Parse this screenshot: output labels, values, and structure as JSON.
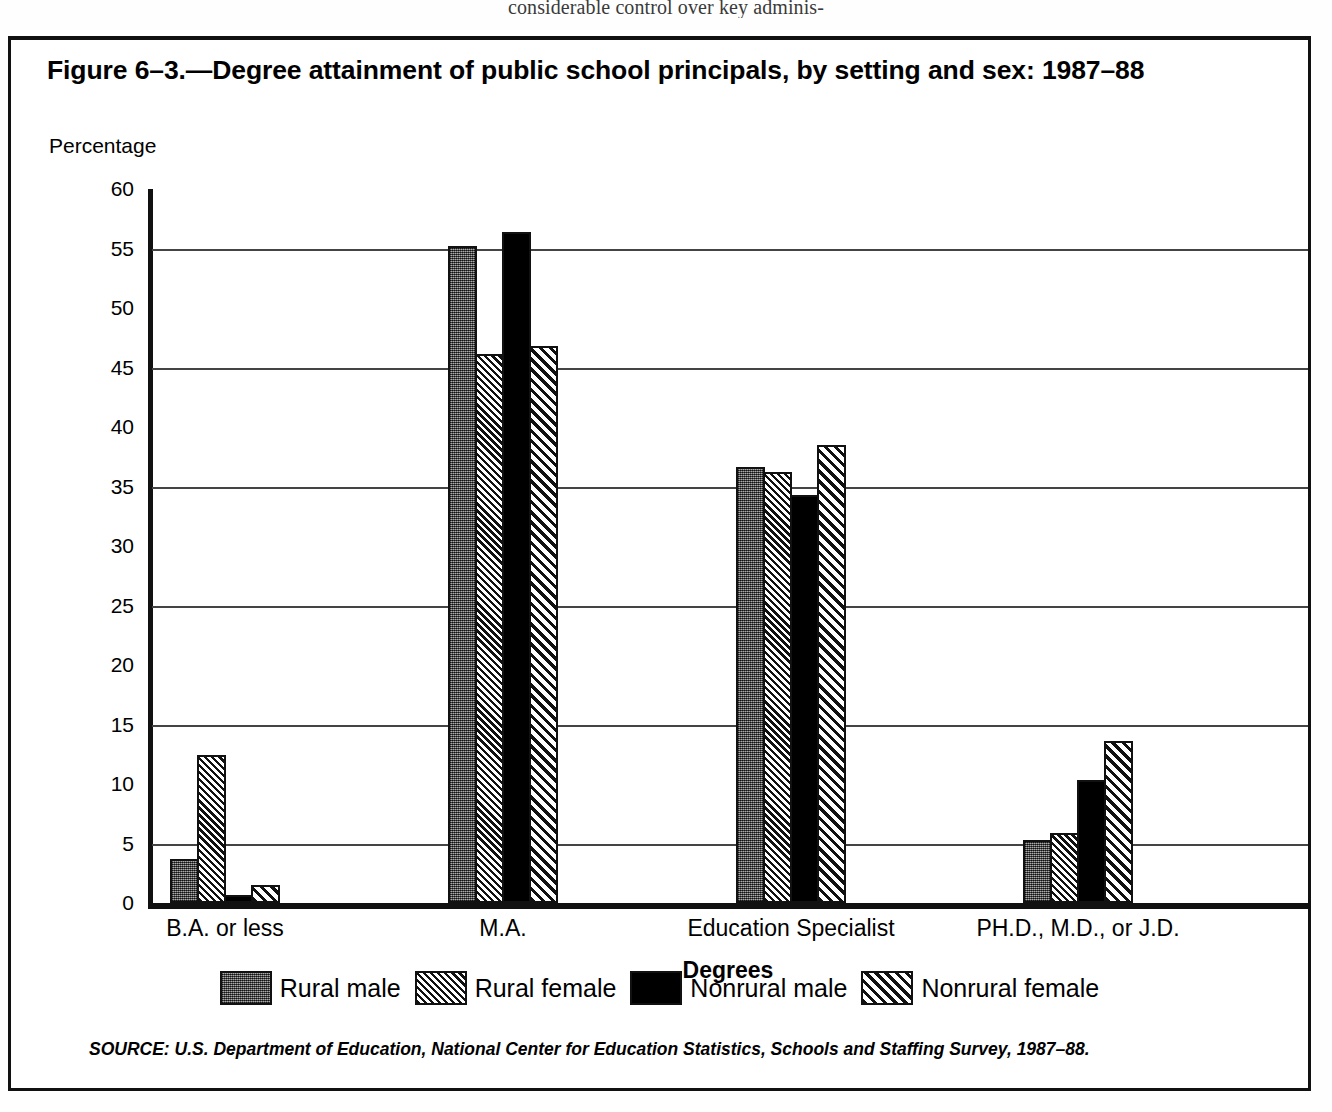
{
  "page": {
    "bleed_text": "considerable control over key adminis-"
  },
  "figure": {
    "title": "Figure 6–3.—Degree attainment of public school principals, by setting and sex: 1987–88",
    "source": "SOURCE: U.S. Department of Education, National Center for Education Statistics, Schools and Staffing Survey, 1987–88."
  },
  "chart_data": {
    "type": "bar",
    "title": "Figure 6–3.—Degree attainment of public school principals, by setting and sex: 1987–88",
    "xlabel": "Degrees",
    "ylabel": "Percentage",
    "ylim": [
      0,
      60
    ],
    "yticks": [
      0,
      5,
      10,
      15,
      20,
      25,
      30,
      35,
      40,
      45,
      50,
      55,
      60
    ],
    "ytick_labels": [
      "0",
      "5",
      "10",
      "15",
      "20",
      "25",
      "30",
      "35",
      "40",
      "45",
      "50",
      "55",
      "60"
    ],
    "gridlines": [
      5,
      15,
      25,
      35,
      45,
      55
    ],
    "grid": true,
    "legend_position": "bottom",
    "categories": [
      "B.A. or less",
      "M.A.",
      "Education Specialist",
      "PH.D., M.D., or J.D."
    ],
    "series": [
      {
        "name": "Rural male",
        "pattern": "solid-dark-gray",
        "color": "#5f5f5f",
        "values": [
          3.7,
          55.2,
          36.6,
          5.3
        ]
      },
      {
        "name": "Rural female",
        "pattern": "fine-crosshatch",
        "color": "#ffffff",
        "values": [
          12.4,
          46.1,
          36.2,
          5.9
        ]
      },
      {
        "name": "Nonrural male",
        "pattern": "solid-black",
        "color": "#000000",
        "values": [
          0.7,
          56.4,
          34.3,
          10.3
        ]
      },
      {
        "name": "Nonrural female",
        "pattern": "diagonal-hatch",
        "color": "#ffffff",
        "values": [
          1.5,
          46.8,
          38.5,
          13.6
        ]
      }
    ]
  }
}
